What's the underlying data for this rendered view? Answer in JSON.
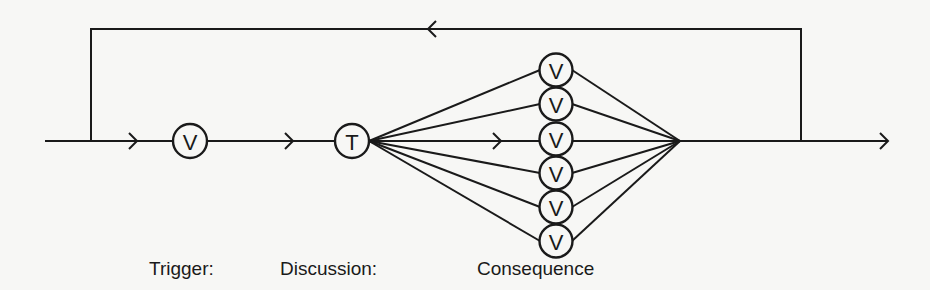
{
  "diagram": {
    "type": "flow-network",
    "main_line": {
      "y": 141,
      "x_start": 45,
      "x_end": 888
    },
    "feedback_loop": {
      "x_left": 91,
      "x_right": 801,
      "y_top": 29,
      "direction": "right-to-left"
    },
    "nodes": [
      {
        "id": "v-trigger",
        "label": "V",
        "cx": 190,
        "cy": 141
      },
      {
        "id": "t-discussion",
        "label": "T",
        "cx": 352,
        "cy": 141
      },
      {
        "id": "v-consequence-1",
        "label": "V",
        "cx": 556,
        "cy": 70
      },
      {
        "id": "v-consequence-2",
        "label": "V",
        "cx": 556,
        "cy": 104
      },
      {
        "id": "v-consequence-3",
        "label": "V",
        "cx": 556,
        "cy": 139
      },
      {
        "id": "v-consequence-4",
        "label": "V",
        "cx": 556,
        "cy": 173
      },
      {
        "id": "v-consequence-5",
        "label": "V",
        "cx": 556,
        "cy": 207
      },
      {
        "id": "v-consequence-6",
        "label": "V",
        "cx": 556,
        "cy": 241
      }
    ],
    "convergence_point": {
      "x": 680,
      "y": 141
    }
  },
  "captions": {
    "trigger": "Trigger:",
    "discussion": "Discussion:",
    "consequence": "Consequence"
  }
}
